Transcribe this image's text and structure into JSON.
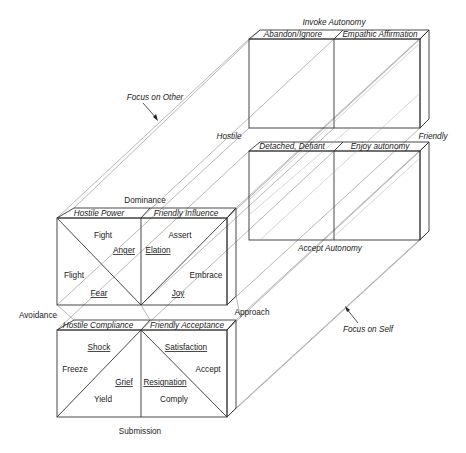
{
  "axes": {
    "top": "Invoke Autonomy",
    "hostile": "Hostile",
    "friendly": "Friendly",
    "accept_autonomy": "Accept Autonomy",
    "dominance": "Dominance",
    "submission": "Submission",
    "avoidance": "Avoidance",
    "approach": "Approach",
    "focus_other": "Focus on Other",
    "focus_self": "Focus on Self"
  },
  "back_upper": {
    "left_title": "Abandon/Ignore",
    "right_title": "Empathic Affirmation"
  },
  "back_lower": {
    "left_title": "Detached, Defiant",
    "right_title": "Enjoy autonomy"
  },
  "front_upper": {
    "left_title": "Hostile Power",
    "right_title": "Friendly Influence",
    "left_items": {
      "fight": "Fight",
      "anger": "Anger",
      "flight": "Flight",
      "fear": "Fear"
    },
    "right_items": {
      "assert": "Assert",
      "elation": "Elation",
      "embrace": "Embrace",
      "joy": "Joy"
    }
  },
  "front_lower": {
    "left_title": "Hostile Compliance",
    "right_title": "Friendly Acceptance",
    "left_items": {
      "shock": "Shock",
      "freeze": "Freeze",
      "grief": "Grief",
      "yield": "Yield"
    },
    "right_items": {
      "satisfaction": "Satisfaction",
      "accept": "Accept",
      "resignation": "Resignation",
      "comply": "Comply"
    }
  }
}
